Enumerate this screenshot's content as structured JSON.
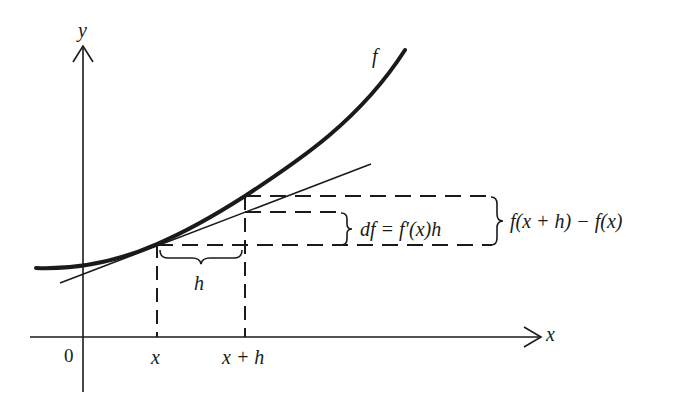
{
  "figure": {
    "axes": {
      "x_label": "x",
      "y_label": "y",
      "origin_label": "0"
    },
    "curve_label": "f",
    "tick_labels": {
      "x": "x",
      "x_plus_h": "x + h"
    },
    "brace_labels": {
      "h": "h",
      "differential": "df = f′(x)h",
      "increment": "f(x + h) − f(x)"
    },
    "colors": {
      "ink": "#1a1a1a",
      "background": "#ffffff"
    }
  }
}
